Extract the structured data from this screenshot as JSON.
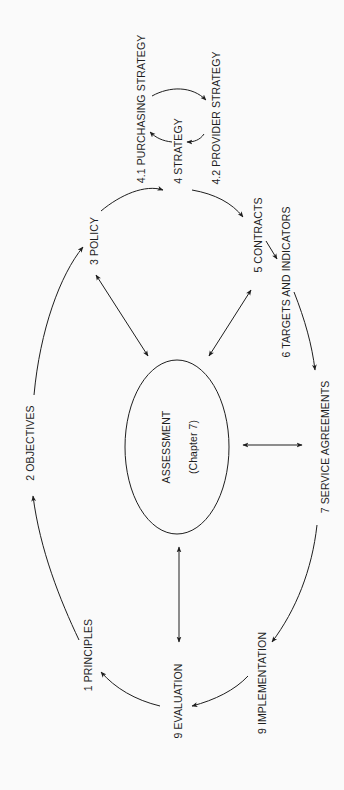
{
  "diagram": {
    "orientation": "rotated -90deg (text reads bottom-to-top)",
    "center": {
      "label": "ASSESSMENT",
      "sublabel": "(Chapter 7)"
    },
    "nodes": [
      {
        "id": "principles",
        "label": "1 PRINCIPLES"
      },
      {
        "id": "objectives",
        "label": "2 OBJECTIVES"
      },
      {
        "id": "policy",
        "label": "3 POLICY"
      },
      {
        "id": "strategy",
        "label": "4 STRATEGY"
      },
      {
        "id": "purchasing",
        "label": "4.1 PURCHASING STRATEGY"
      },
      {
        "id": "provider",
        "label": "4.2 PROVIDER STRATEGY"
      },
      {
        "id": "contracts",
        "label": "5 CONTRACTS"
      },
      {
        "id": "targets",
        "label": "6 TARGETS AND INDICATORS"
      },
      {
        "id": "service",
        "label": "7 SERVICE AGREEMENTS"
      },
      {
        "id": "implementation",
        "label": "9 IMPLEMENTATION"
      },
      {
        "id": "evaluation",
        "label": "9 EVALUATION"
      }
    ],
    "edges": [
      {
        "from": "principles",
        "to": "objectives",
        "type": "directed"
      },
      {
        "from": "objectives",
        "to": "policy",
        "type": "directed"
      },
      {
        "from": "policy",
        "to": "strategy",
        "type": "directed"
      },
      {
        "from": "strategy",
        "to": "purchasing",
        "type": "directed"
      },
      {
        "from": "purchasing",
        "to": "provider",
        "type": "directed"
      },
      {
        "from": "provider",
        "to": "strategy",
        "type": "directed"
      },
      {
        "from": "strategy",
        "to": "contracts",
        "type": "directed"
      },
      {
        "from": "contracts",
        "to": "targets",
        "type": "directed"
      },
      {
        "from": "targets",
        "to": "service",
        "type": "directed"
      },
      {
        "from": "service",
        "to": "implementation",
        "type": "directed"
      },
      {
        "from": "implementation",
        "to": "evaluation",
        "type": "directed"
      },
      {
        "from": "evaluation",
        "to": "principles",
        "type": "directed"
      },
      {
        "from": "assessment",
        "to": "policy",
        "type": "bidirectional"
      },
      {
        "from": "assessment",
        "to": "contracts",
        "type": "bidirectional"
      },
      {
        "from": "assessment",
        "to": "service",
        "type": "bidirectional"
      },
      {
        "from": "assessment",
        "to": "evaluation",
        "type": "bidirectional"
      }
    ],
    "colors": {
      "background": "#fafafa",
      "ink": "#1e1e1e"
    }
  }
}
